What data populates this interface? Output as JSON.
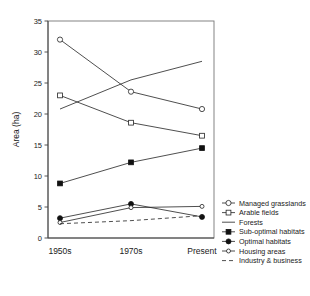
{
  "chart_data": {
    "type": "line",
    "title": "",
    "xlabel": "",
    "ylabel": "Area (ha)",
    "categories": [
      "1950s",
      "1970s",
      "Present"
    ],
    "ylim": [
      0,
      35
    ],
    "yticks": [
      0,
      5,
      10,
      15,
      20,
      25,
      30,
      35
    ],
    "ytick_labels": [
      "0",
      "5",
      "10",
      "15",
      "20",
      "25",
      "30",
      "35"
    ],
    "grid": false,
    "legend_position": "right",
    "series": [
      {
        "name": "Managed grasslands",
        "marker": "open-circle",
        "linestyle": "solid",
        "values": [
          32.0,
          23.6,
          20.8
        ]
      },
      {
        "name": "Arable fields",
        "marker": "open-square",
        "linestyle": "solid",
        "values": [
          23.0,
          18.6,
          16.5
        ]
      },
      {
        "name": "Forests",
        "marker": "none",
        "linestyle": "solid",
        "values": [
          20.8,
          25.5,
          28.5
        ]
      },
      {
        "name": "Sub-optimal habitats",
        "marker": "filled-square",
        "linestyle": "solid",
        "values": [
          8.8,
          12.2,
          14.5
        ]
      },
      {
        "name": "Optimal habitats",
        "marker": "filled-circle",
        "linestyle": "solid",
        "values": [
          3.2,
          5.5,
          3.4
        ]
      },
      {
        "name": "Housing areas",
        "marker": "open-circle-small",
        "linestyle": "solid",
        "values": [
          2.5,
          4.9,
          5.1
        ]
      },
      {
        "name": "Industry & business",
        "marker": "none",
        "linestyle": "dashed",
        "values": [
          2.3,
          2.8,
          3.6
        ]
      }
    ]
  },
  "axes": {
    "y_title": "Area (ha)"
  },
  "legend": {
    "entries": [
      "Managed grasslands",
      "Arable fields",
      "Forests",
      "Sub-optimal habitats",
      "Optimal habitats",
      "Housing areas",
      "Industry & business"
    ]
  },
  "colors": {
    "line": "#222222",
    "marker_fill": "#111111",
    "marker_open": "#ffffff",
    "axis": "#444444",
    "frame": "#777777",
    "background": "#ffffff"
  }
}
